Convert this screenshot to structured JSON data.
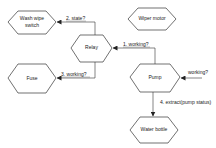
{
  "diagram": {
    "type": "sequence-flow",
    "nodes": [
      {
        "id": "wash_wipe_switch",
        "label_line1": "Wash wipe",
        "label_line2": "switch"
      },
      {
        "id": "wiper_motor",
        "label": "Wiper motor"
      },
      {
        "id": "relay",
        "label": "Relay"
      },
      {
        "id": "pump",
        "label": "Pump"
      },
      {
        "id": "fuse",
        "label": "Fuse"
      },
      {
        "id": "water_bottle",
        "label": "Water bottle"
      }
    ],
    "edges": [
      {
        "id": "e1",
        "from": "pump",
        "to": "relay",
        "label": "1. working?"
      },
      {
        "id": "e2",
        "from": "relay",
        "to": "wash_wipe_switch",
        "label": "2. state?"
      },
      {
        "id": "e3",
        "from": "relay",
        "to": "fuse",
        "label": "3. working?"
      },
      {
        "id": "e4",
        "from": "pump",
        "to": "water_bottle",
        "label": "4. extract(pump status)"
      },
      {
        "id": "e0",
        "from": "external",
        "to": "pump",
        "label": "working?"
      }
    ],
    "colors": {
      "stroke": "#333333",
      "background": "#ffffff",
      "text": "#222222"
    }
  }
}
